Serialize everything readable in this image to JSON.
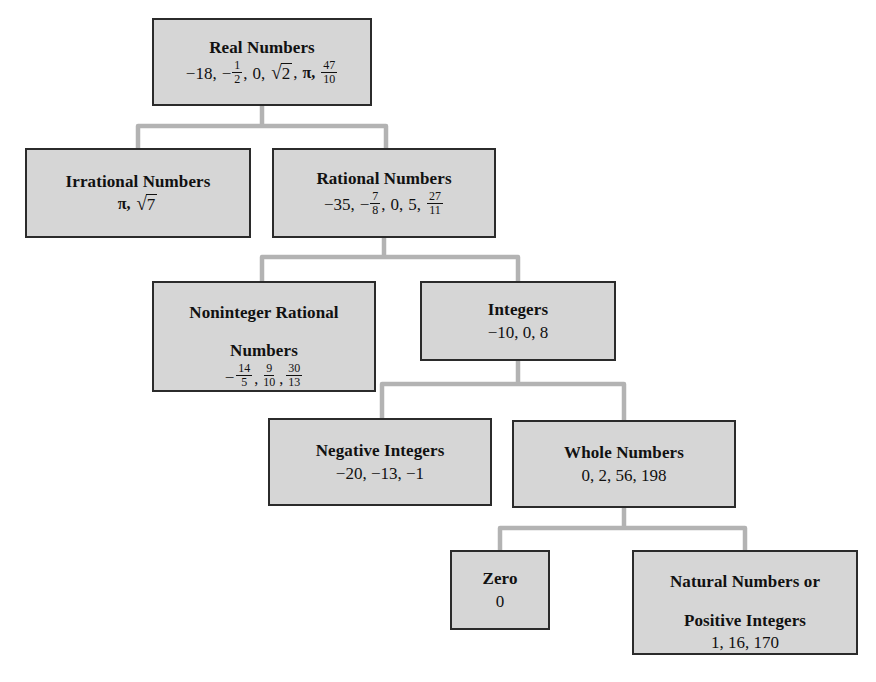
{
  "diagram": {
    "type": "hierarchy-tree",
    "box_fill_color": "#d6d6d6",
    "box_border_color": "#2b2b2b",
    "connector_color": "#b3b3b3",
    "background_color": "#ffffff",
    "nodes": [
      {
        "id": "real-numbers",
        "title": "Real Numbers",
        "examples_text": "−18, −½, 0, √2, π, 47/10",
        "examples": [
          "−18",
          "−1/2",
          "0",
          "√2",
          "π",
          "47/10"
        ]
      },
      {
        "id": "irrational-numbers",
        "title": "Irrational Numbers",
        "examples_text": "π, √7",
        "examples": [
          "π",
          "√7"
        ]
      },
      {
        "id": "rational-numbers",
        "title": "Rational Numbers",
        "examples_text": "−35, −7/8, 0, 5, 27/11",
        "examples": [
          "−35",
          "−7/8",
          "0",
          "5",
          "27/11"
        ]
      },
      {
        "id": "noninteger-rational-numbers",
        "title": "Noninteger Rational\nNumbers",
        "examples_text": "−14/5, 9/10, 30/13",
        "examples": [
          "−14/5",
          "9/10",
          "30/13"
        ]
      },
      {
        "id": "integers",
        "title": "Integers",
        "examples_text": "−10, 0, 8",
        "examples": [
          "−10",
          "0",
          "8"
        ]
      },
      {
        "id": "negative-integers",
        "title": "Negative Integers",
        "examples_text": "−20, −13, −1",
        "examples": [
          "−20",
          "−13",
          "−1"
        ]
      },
      {
        "id": "whole-numbers",
        "title": "Whole Numbers",
        "examples_text": "0, 2, 56, 198",
        "examples": [
          "0",
          "2",
          "56",
          "198"
        ]
      },
      {
        "id": "zero",
        "title": "Zero",
        "examples_text": "0",
        "examples": [
          "0"
        ]
      },
      {
        "id": "natural-numbers",
        "title": "Natural Numbers or\nPositive Integers",
        "examples_text": "1, 16, 170",
        "examples": [
          "1",
          "16",
          "170"
        ]
      }
    ],
    "edges": [
      {
        "from": "real-numbers",
        "to": "irrational-numbers"
      },
      {
        "from": "real-numbers",
        "to": "rational-numbers"
      },
      {
        "from": "rational-numbers",
        "to": "noninteger-rational-numbers"
      },
      {
        "from": "rational-numbers",
        "to": "integers"
      },
      {
        "from": "integers",
        "to": "negative-integers"
      },
      {
        "from": "integers",
        "to": "whole-numbers"
      },
      {
        "from": "whole-numbers",
        "to": "zero"
      },
      {
        "from": "whole-numbers",
        "to": "natural-numbers"
      }
    ],
    "labels": {
      "real_numbers": "Real Numbers",
      "irrational_numbers": "Irrational Numbers",
      "rational_numbers": "Rational Numbers",
      "noninteger_rational_line1": "Noninteger Rational",
      "noninteger_rational_line2": "Numbers",
      "integers": "Integers",
      "negative_integers": "Negative Integers",
      "whole_numbers": "Whole Numbers",
      "zero": "Zero",
      "natural_line1": "Natural Numbers or",
      "natural_line2": "Positive Integers"
    },
    "values": {
      "real_neg18": "−18,",
      "real_half_num": "1",
      "real_half_den": "2",
      "real_zero": "0,",
      "real_sqrt2": "2",
      "real_pi": "π,",
      "real_47_num": "47",
      "real_47_den": "10",
      "irr_pi": "π,",
      "irr_sqrt7": "7",
      "rat_neg35": "−35,",
      "rat_7_num": "7",
      "rat_7_den": "8",
      "rat_zero": "0,",
      "rat_five": "5,",
      "rat_27_num": "27",
      "rat_27_den": "11",
      "non_14_num": "14",
      "non_14_den": "5",
      "non_9_num": "9",
      "non_9_den": "10",
      "non_30_num": "30",
      "non_30_den": "13",
      "int_values": "−10, 0, 8",
      "neg_int_values": "−20, −13, −1",
      "whole_values": "0, 2, 56, 198",
      "zero_value": "0",
      "natural_values": "1, 16, 170",
      "minus": "−",
      "comma": ",",
      "radical": "√"
    }
  }
}
